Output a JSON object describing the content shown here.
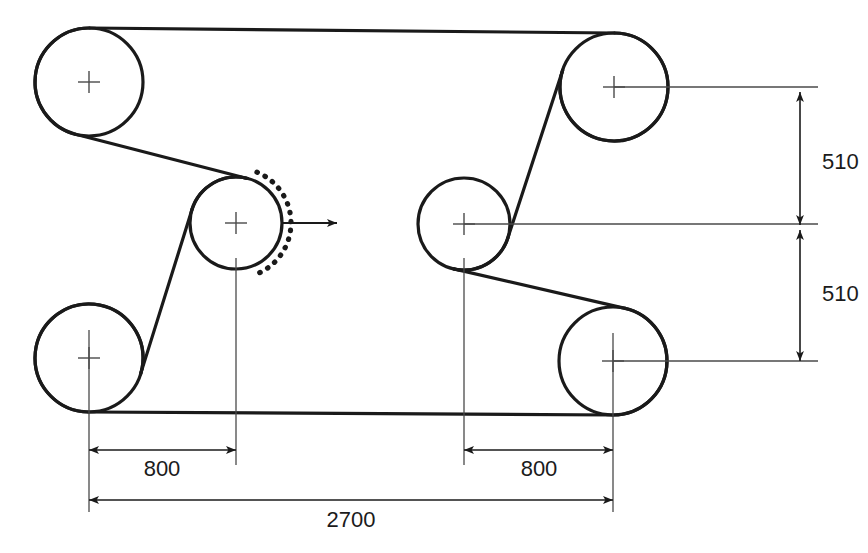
{
  "diagram": {
    "units": "mm",
    "stroke_color": "#1a1a1a",
    "thin_stroke_color": "#4a4a4a",
    "background": "#ffffff",
    "belt_width_px": 3.2,
    "pulleys": [
      {
        "id": "top-left",
        "cx": 89,
        "cy": 82,
        "r": 54,
        "center_mark": "cross"
      },
      {
        "id": "top-right",
        "cx": 614,
        "cy": 87,
        "r": 54,
        "center_mark": "cross"
      },
      {
        "id": "middle-left",
        "cx": 236,
        "cy": 223,
        "r": 46,
        "center_mark": "cross"
      },
      {
        "id": "middle-right",
        "cx": 464,
        "cy": 224,
        "r": 46,
        "center_mark": "cross"
      },
      {
        "id": "bottom-left",
        "cx": 89,
        "cy": 358,
        "r": 54,
        "center_mark": "cross"
      },
      {
        "id": "bottom-right",
        "cx": 613,
        "cy": 361,
        "r": 54,
        "center_mark": "cross"
      }
    ],
    "displacement_indicator": {
      "id": "belt-displacement-arc",
      "style": "dotted",
      "anchor_pulley": "middle-left",
      "arrow_direction": "right",
      "arrow_y": 223,
      "arrow_x_start": 282,
      "arrow_x_end": 337
    },
    "dimensions": [
      {
        "id": "vertical-upper",
        "label": "510",
        "orientation": "vertical",
        "line_x": 800,
        "y_from": 92,
        "y_to": 225,
        "label_x": 822,
        "label_y": 163
      },
      {
        "id": "vertical-lower",
        "label": "510",
        "orientation": "vertical",
        "line_x": 800,
        "y_from": 230,
        "y_to": 361,
        "label_x": 822,
        "label_y": 295
      },
      {
        "id": "horizontal-left-800",
        "label": "800",
        "orientation": "horizontal",
        "line_y": 450,
        "x_from": 89,
        "x_to": 236,
        "label_x": 162,
        "label_y": 470
      },
      {
        "id": "horizontal-right-800",
        "label": "800",
        "orientation": "horizontal",
        "line_y": 450,
        "x_from": 464,
        "x_to": 613,
        "label_x": 539,
        "label_y": 470
      },
      {
        "id": "horizontal-total-2700",
        "label": "2700",
        "orientation": "horizontal",
        "line_y": 500,
        "x_from": 89,
        "x_to": 613,
        "label_x": 351,
        "label_y": 521
      }
    ],
    "extension_lines": [
      {
        "id": "ext-top-right-center",
        "x1": 614,
        "y1": 87,
        "x2": 818,
        "y2": 87
      },
      {
        "id": "ext-middle-right-center",
        "x1": 464,
        "y1": 224,
        "x2": 818,
        "y2": 224
      },
      {
        "id": "ext-bottom-right-center",
        "x1": 613,
        "y1": 361,
        "x2": 818,
        "y2": 361
      },
      {
        "id": "ext-bottom-left-down",
        "x1": 89,
        "y1": 330,
        "x2": 89,
        "y2": 512
      },
      {
        "id": "ext-middle-left-down",
        "x1": 236,
        "y1": 258,
        "x2": 236,
        "y2": 465
      },
      {
        "id": "ext-middle-right-down",
        "x1": 464,
        "y1": 258,
        "x2": 464,
        "y2": 465
      },
      {
        "id": "ext-bottom-right-down",
        "x1": 613,
        "y1": 333,
        "x2": 613,
        "y2": 512
      }
    ]
  }
}
